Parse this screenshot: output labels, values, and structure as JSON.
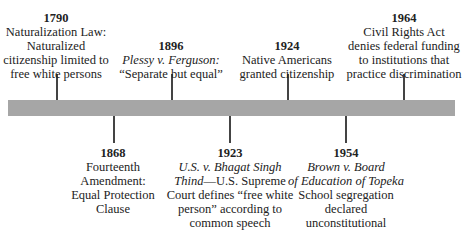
{
  "timeline": {
    "bar_color": "#a6a6a6",
    "events_above": [
      {
        "year": "1790",
        "title_italic": "",
        "text": "Naturalization Law: Naturalized citizenship limited to free white persons",
        "lines": [
          "Naturalization Law:",
          "Naturalized",
          "citizenship limited to",
          "free white persons"
        ]
      },
      {
        "year": "1896",
        "title_italic": "Plessy v. Ferguson:",
        "text": "“Separate but equal”",
        "lines": [
          "“Separate but equal”"
        ]
      },
      {
        "year": "1924",
        "title_italic": "",
        "text": "Native Americans granted citizenship",
        "lines": [
          "Native Americans",
          "granted citizenship"
        ]
      },
      {
        "year": "1964",
        "title_italic": "",
        "text": "Civil Rights Act denies federal funding to institutions that practice discrimination",
        "lines": [
          "Civil Rights Act",
          "denies federal funding",
          "to institutions that",
          "practice discrimination"
        ]
      }
    ],
    "events_below": [
      {
        "year": "1868",
        "title_italic": "",
        "lines": [
          "Fourteenth",
          "Amendment:",
          "Equal Protection",
          "Clause"
        ]
      },
      {
        "year": "1923",
        "title_italic_1": "U.S. v. Bhagat Singh",
        "title_italic_2": "Thind",
        "rest_2": "—U.S. Supreme",
        "lines": [
          "Court defines “free white",
          "person” according to",
          "common speech"
        ]
      },
      {
        "year": "1954",
        "title_italic_1": "Brown v. Board",
        "title_italic_2": "of Education of Topeka",
        "lines": [
          "School segregation",
          "declared",
          "unconstitutional"
        ]
      }
    ]
  }
}
